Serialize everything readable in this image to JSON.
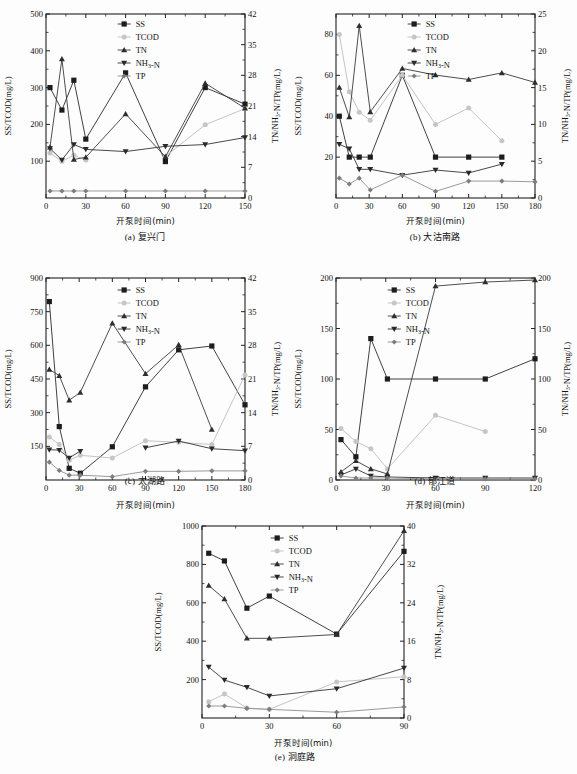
{
  "figure": {
    "axis_labels": {
      "x": "开泵时间(min)",
      "y_left_a": "SS/TCOD(mg/L)",
      "y_right_a": "TN/NH₃-N/TP(mg/L)"
    },
    "legend": [
      {
        "key": "SS",
        "label": "SS",
        "marker": "square",
        "color": "#1d1d1d"
      },
      {
        "key": "TCOD",
        "label": "TCOD",
        "marker": "circle",
        "color": "#c6c6c6"
      },
      {
        "key": "TN",
        "label": "TN",
        "marker": "triangle-up",
        "color": "#2e2e2e"
      },
      {
        "key": "NH3N",
        "label": "NH₃-N",
        "marker": "triangle-down",
        "color": "#2a2a2a"
      },
      {
        "key": "TP",
        "label": "TP",
        "marker": "diamond",
        "color": "#7d7d7d"
      }
    ],
    "captions": {
      "a": "(a) 复兴门",
      "b": "(b) 大沽南路",
      "c": "(c) 太湖路",
      "d": "(d) 郁江道",
      "e": "(e) 洞庭路"
    }
  },
  "chart_data": [
    {
      "id": "a",
      "type": "line",
      "title": "(a) 复兴门",
      "xlabel": "开泵时间(min)",
      "ylabel": "SS/TCOD(mg/L)",
      "ylabel_right": "TN/NH₃-N/TP(mg/L)",
      "xlim": [
        0,
        150
      ],
      "xticks": [
        0,
        30,
        60,
        90,
        120,
        150
      ],
      "ylim": [
        0,
        500
      ],
      "yticks": [
        100,
        200,
        300,
        400,
        500
      ],
      "ylim_right": [
        0,
        42
      ],
      "yticks_right": [
        0,
        7,
        14,
        21,
        28,
        35,
        42
      ],
      "grid": false,
      "legend_position": "top-center",
      "x": [
        3,
        12,
        21,
        30,
        60,
        90,
        120,
        150
      ],
      "series": [
        {
          "name": "SS",
          "axis": "left",
          "values": [
            300,
            239,
            320,
            160,
            340,
            99,
            300,
            255
          ]
        },
        {
          "name": "TCOD",
          "axis": "left",
          "values": [
            122,
            100,
            116,
            103,
            null,
            113,
            199,
            243
          ]
        },
        {
          "name": "TN",
          "axis": "right",
          "values": [
            11.6,
            31.7,
            8.8,
            9.3,
            19.2,
            9.4,
            26.2,
            20.5
          ]
        },
        {
          "name": "NH₃-N",
          "axis": "right",
          "values": [
            11.3,
            8.7,
            12.2,
            11.1,
            10.6,
            11.8,
            12.2,
            13.8
          ]
        },
        {
          "name": "TP",
          "axis": "right",
          "values": [
            1.6,
            1.6,
            1.6,
            1.6,
            1.6,
            1.6,
            1.6,
            1.6
          ]
        }
      ]
    },
    {
      "id": "b",
      "type": "line",
      "title": "(b) 大沽南路",
      "xlabel": "开泵时间(min)",
      "ylabel": "SS/TCOD(mg/L)",
      "ylabel_right": "TN/NH₃-N/TP(mg/L)",
      "xlim": [
        0,
        180
      ],
      "xticks": [
        0,
        30,
        60,
        90,
        120,
        150,
        180
      ],
      "ylim": [
        0,
        90
      ],
      "yticks": [
        20,
        40,
        60,
        80
      ],
      "ylim_right": [
        0,
        25
      ],
      "yticks_right": [
        0,
        5,
        10,
        15,
        20,
        25
      ],
      "grid": false,
      "legend_position": "top-center",
      "x": [
        3,
        12,
        21,
        31,
        60,
        90,
        120,
        150,
        180
      ],
      "series": [
        {
          "name": "SS",
          "axis": "left",
          "values": [
            40,
            20,
            20,
            20,
            60,
            20,
            20,
            20,
            null
          ]
        },
        {
          "name": "TCOD",
          "axis": "left",
          "values": [
            80,
            52,
            42,
            38,
            60,
            36,
            44,
            28,
            null
          ]
        },
        {
          "name": "TN",
          "axis": "right",
          "values": [
            15.0,
            11.0,
            23.4,
            11.7,
            17.6,
            16.7,
            16.1,
            17.0,
            15.7
          ]
        },
        {
          "name": "NH₃-N",
          "axis": "right",
          "values": [
            7.3,
            6.7,
            3.9,
            3.9,
            3.1,
            3.8,
            3.4,
            4.6,
            null
          ]
        },
        {
          "name": "TP",
          "axis": "right",
          "values": [
            2.7,
            1.9,
            2.7,
            1.1,
            3.1,
            0.9,
            2.3,
            2.3,
            2.2
          ]
        }
      ]
    },
    {
      "id": "c",
      "type": "line",
      "title": "(c) 太湖路",
      "xlabel": "开泵时间(min)",
      "ylabel": "SS/TCOD(mg/L)",
      "ylabel_right": "TN/NH₃-N/TP(mg/L)",
      "xlim": [
        0,
        180
      ],
      "xticks": [
        0,
        30,
        60,
        90,
        120,
        150,
        180
      ],
      "ylim": [
        0,
        900
      ],
      "yticks": [
        150,
        300,
        450,
        600,
        750,
        900
      ],
      "ylim_right": [
        0,
        42
      ],
      "yticks_right": [
        0,
        7,
        14,
        21,
        28,
        35,
        42
      ],
      "grid": false,
      "legend_position": "top-center",
      "x": [
        3,
        12,
        21,
        31,
        60,
        90,
        120,
        150,
        180
      ],
      "series": [
        {
          "name": "SS",
          "axis": "left",
          "values": [
            795,
            238,
            52,
            30,
            148,
            415,
            580,
            597,
            335
          ]
        },
        {
          "name": "TCOD",
          "axis": "left",
          "values": [
            192,
            158,
            88,
            110,
            98,
            175,
            168,
            158,
            468
          ]
        },
        {
          "name": "TN",
          "axis": "right",
          "values": [
            23.0,
            21.7,
            16.6,
            18.2,
            32.6,
            22.1,
            28.1,
            10.5,
            null
          ]
        },
        {
          "name": "NH₃-N",
          "axis": "right",
          "values": [
            6.3,
            6.2,
            4.6,
            6.0,
            null,
            6.7,
            8.1,
            6.5,
            6.1
          ]
        },
        {
          "name": "TP",
          "axis": "right",
          "values": [
            3.7,
            2.0,
            1.0,
            1.0,
            0.7,
            1.8,
            1.8,
            1.9,
            1.9
          ]
        }
      ]
    },
    {
      "id": "d",
      "type": "line",
      "title": "(d) 郁江道",
      "xlabel": "开泵时间(min)",
      "ylabel": "SS/TCOD(mg/L)",
      "ylabel_right": "TN/NH₃-N/TP(mg/L)",
      "xlim": [
        0,
        120
      ],
      "xticks": [
        0,
        30,
        60,
        90,
        120
      ],
      "ylim": [
        0,
        200
      ],
      "yticks": [
        0,
        50,
        100,
        150,
        200
      ],
      "ylim_right": [
        0,
        200
      ],
      "yticks_right": [
        0,
        50,
        100,
        150,
        200
      ],
      "grid": false,
      "legend_position": "top-center",
      "x": [
        3,
        12,
        21,
        31,
        60,
        90,
        120
      ],
      "series": [
        {
          "name": "SS",
          "axis": "left",
          "values": [
            40,
            23,
            140,
            100,
            100,
            100,
            120
          ]
        },
        {
          "name": "TCOD",
          "axis": "left",
          "values": [
            51,
            38,
            31,
            11,
            64,
            48,
            null
          ]
        },
        {
          "name": "TN",
          "axis": "right",
          "values": [
            8,
            19,
            11,
            6,
            192,
            196,
            198
          ]
        },
        {
          "name": "NH₃-N",
          "axis": "right",
          "values": [
            5,
            11,
            4,
            3,
            2,
            2,
            2
          ]
        },
        {
          "name": "TP",
          "axis": "right",
          "values": [
            4,
            2,
            2,
            2,
            1,
            1,
            1
          ]
        }
      ]
    },
    {
      "id": "e",
      "type": "line",
      "title": "(e) 洞庭路",
      "xlabel": "开泵时间(min)",
      "ylabel": "SS/TCOD(mg/L)",
      "ylabel_right": "TN/NH₃-N/TP(mg/L)",
      "xlim": [
        0,
        90
      ],
      "xticks": [
        0,
        30,
        60,
        90
      ],
      "ylim": [
        0,
        1000
      ],
      "yticks": [
        200,
        400,
        600,
        800,
        1000
      ],
      "ylim_right": [
        0,
        40
      ],
      "yticks_right": [
        0,
        8,
        16,
        24,
        32,
        40
      ],
      "grid": false,
      "legend_position": "top-center",
      "x": [
        3,
        10,
        20,
        30,
        60,
        90
      ],
      "series": [
        {
          "name": "SS",
          "axis": "left",
          "values": [
            858,
            818,
            572,
            635,
            437,
            868
          ]
        },
        {
          "name": "TCOD",
          "axis": "left",
          "values": [
            85,
            125,
            52,
            45,
            188,
            215
          ]
        },
        {
          "name": "TN",
          "axis": "right",
          "values": [
            27.6,
            24.8,
            16.6,
            16.6,
            17.4,
            39.0
          ]
        },
        {
          "name": "NH₃-N",
          "axis": "right",
          "values": [
            10.6,
            7.9,
            6.4,
            4.6,
            6.1,
            10.4
          ]
        },
        {
          "name": "TP",
          "axis": "right",
          "values": [
            2.5,
            2.5,
            2.0,
            1.8,
            1.2,
            2.3
          ]
        }
      ]
    }
  ]
}
